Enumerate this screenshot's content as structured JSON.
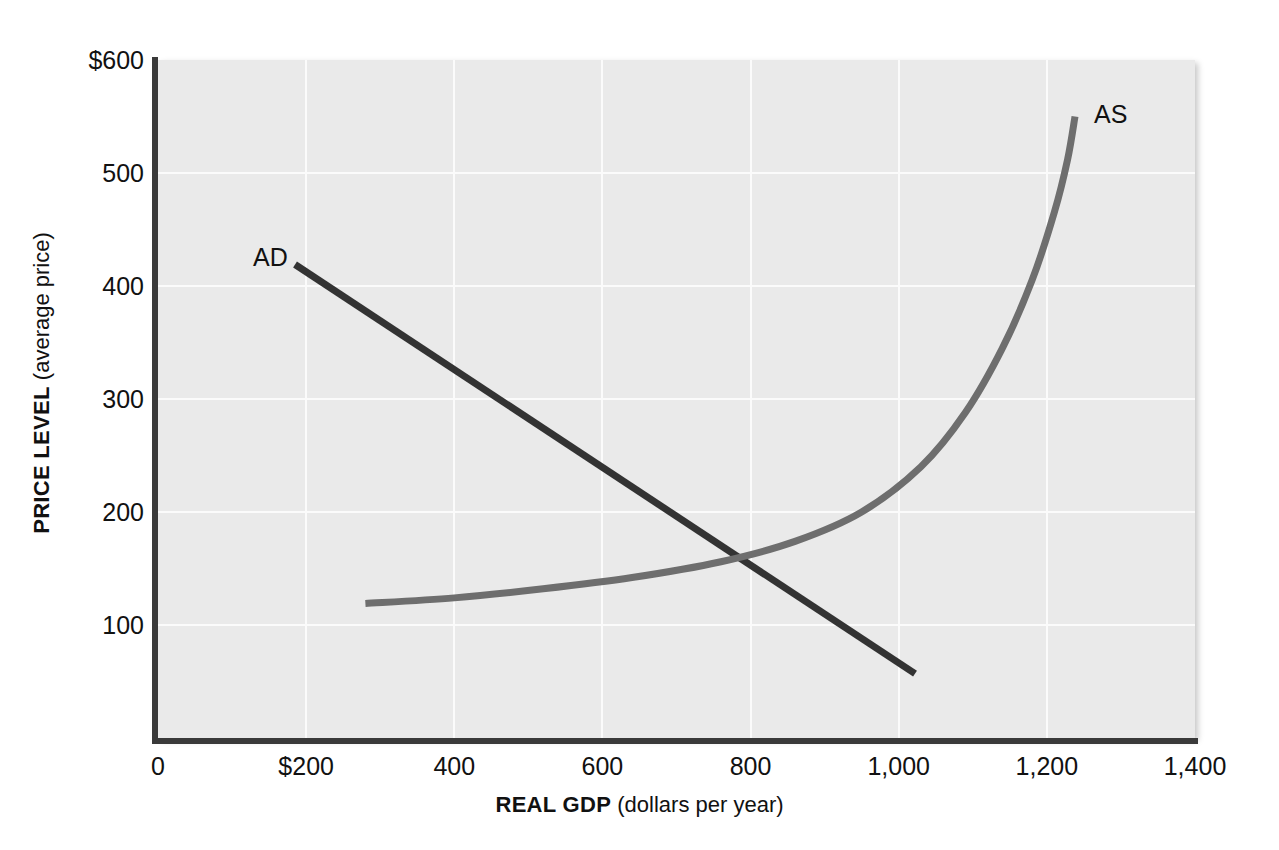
{
  "figure": {
    "background_color": "#ffffff",
    "plot_background_color": "#eaeaea",
    "gridline_color": "#fbfbfb",
    "axis_color": "#3a3a3a"
  },
  "chart_data": {
    "type": "line",
    "title": "",
    "subtitle": "",
    "xlabel_strong": "REAL GDP",
    "xlabel_rest": " (dollars per year)",
    "ylabel_strong": "PRICE LEVEL",
    "ylabel_rest": " (average price)",
    "xlim": [
      0,
      1400
    ],
    "ylim": [
      0,
      600
    ],
    "grid": true,
    "legend_position": "inline-curve-labels",
    "xticks": [
      {
        "value": 0,
        "label": "0"
      },
      {
        "value": 200,
        "label": "$200"
      },
      {
        "value": 400,
        "label": "400"
      },
      {
        "value": 600,
        "label": "600"
      },
      {
        "value": 800,
        "label": "800"
      },
      {
        "value": 1000,
        "label": "1,000"
      },
      {
        "value": 1200,
        "label": "1,200"
      },
      {
        "value": 1400,
        "label": "1,400"
      }
    ],
    "yticks": [
      {
        "value": 600,
        "label": "$600"
      },
      {
        "value": 500,
        "label": "500"
      },
      {
        "value": 400,
        "label": "400"
      },
      {
        "value": 300,
        "label": "300"
      },
      {
        "value": 200,
        "label": "200"
      },
      {
        "value": 100,
        "label": "100"
      }
    ],
    "series": [
      {
        "name": "AD",
        "label": "AD",
        "description": "Aggregate demand: downward-sloping straight line",
        "color": "#333333",
        "linewidth": 7,
        "points": [
          {
            "x": 185,
            "y": 419
          },
          {
            "x": 1022,
            "y": 57
          }
        ]
      },
      {
        "name": "AS",
        "label": "AS",
        "description": "Aggregate supply: upward-sloping convex curve, nearly vertical at high GDP",
        "color": "#6e6e6e",
        "linewidth": 7,
        "points": [
          {
            "x": 280,
            "y": 119
          },
          {
            "x": 400,
            "y": 124
          },
          {
            "x": 520,
            "y": 132
          },
          {
            "x": 640,
            "y": 142
          },
          {
            "x": 760,
            "y": 156
          },
          {
            "x": 860,
            "y": 174
          },
          {
            "x": 950,
            "y": 200
          },
          {
            "x": 1030,
            "y": 240
          },
          {
            "x": 1090,
            "y": 288
          },
          {
            "x": 1140,
            "y": 345
          },
          {
            "x": 1180,
            "y": 405
          },
          {
            "x": 1210,
            "y": 465
          },
          {
            "x": 1228,
            "y": 512
          },
          {
            "x": 1238,
            "y": 550
          }
        ]
      }
    ],
    "annotations": [
      {
        "name": "equilibrium",
        "x": 800,
        "y": 155,
        "note": "AD and AS intersect"
      }
    ]
  }
}
